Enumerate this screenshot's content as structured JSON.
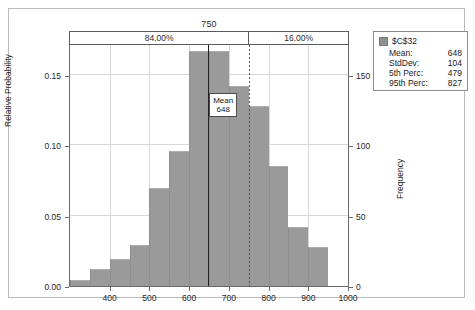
{
  "chart_data": {
    "type": "bar",
    "title": "750",
    "xlabel": "",
    "ylabel": "Relative Probability",
    "ylabel_right": "Frequency",
    "xlim": [
      300,
      1000
    ],
    "ylim": [
      0,
      0.1714
    ],
    "ylim_right": [
      0,
      171.4
    ],
    "grid": true,
    "legend_position": "top-right",
    "bin_width": 50,
    "categories": [
      "300-350",
      "350-400",
      "400-450",
      "450-500",
      "500-550",
      "550-600",
      "600-650",
      "650-700",
      "700-750",
      "750-800",
      "800-850",
      "850-900",
      "900-950"
    ],
    "x": [
      325,
      375,
      425,
      475,
      525,
      575,
      625,
      675,
      725,
      775,
      825,
      875,
      925
    ],
    "values": [
      0.004,
      0.012,
      0.019,
      0.029,
      0.07,
      0.096,
      0.167,
      0.167,
      0.142,
      0.128,
      0.085,
      0.042,
      0.028
    ],
    "values_frequency": [
      4,
      12,
      19,
      29,
      70,
      96,
      167,
      167,
      142,
      128,
      85,
      42,
      28
    ],
    "series": [
      {
        "name": "$C$32",
        "color": "#9a9a9a",
        "values": [
          0.004,
          0.012,
          0.019,
          0.029,
          0.07,
          0.096,
          0.167,
          0.167,
          0.142,
          0.128,
          0.085,
          0.042,
          0.028
        ]
      }
    ],
    "yticks": [
      "0.00",
      "0.05",
      "0.10",
      "0.15"
    ],
    "ytick_values": [
      0.0,
      0.05,
      0.1,
      0.15
    ],
    "yticks_right": [
      "0",
      "50",
      "100",
      "150"
    ],
    "ytick_right_values": [
      0,
      50,
      100,
      150
    ],
    "xticks": [
      "400",
      "500",
      "600",
      "700",
      "800",
      "900",
      "1000"
    ],
    "xtick_values": [
      400,
      500,
      600,
      700,
      800,
      900,
      1000
    ],
    "annotations": [
      {
        "name": "mean-line",
        "label": "Mean",
        "value": "648",
        "x": 648
      },
      {
        "name": "certainty-divider",
        "label": "750",
        "x": 750
      }
    ]
  },
  "certainty_band": {
    "threshold_label": "750",
    "left_percent": "84.00%",
    "right_percent": "16.00%"
  },
  "mean_marker": {
    "label": "Mean",
    "value": "648"
  },
  "axes": {
    "left_title": "Relative Probability",
    "right_title": "Frequency"
  },
  "legend": {
    "series_name": "$C$32",
    "swatch_color": "#8f8f8f",
    "stats": [
      {
        "label": "Mean:",
        "value": "648"
      },
      {
        "label": "StdDev:",
        "value": "104"
      },
      {
        "label": "5th Perc:",
        "value": "479"
      },
      {
        "label": "95th Perc:",
        "value": "827"
      }
    ]
  }
}
